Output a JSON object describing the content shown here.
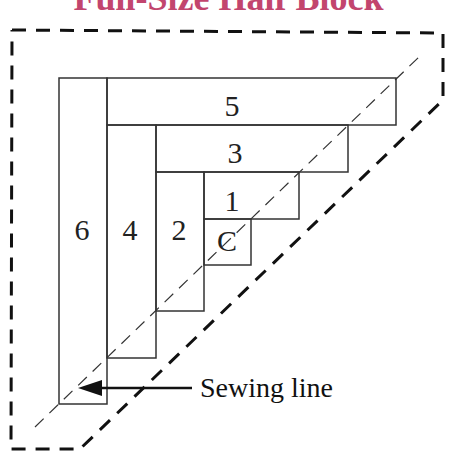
{
  "title": {
    "text": "Full-Size Half Block",
    "color": "#c2456e"
  },
  "diagram": {
    "pieces": [
      {
        "id": "C",
        "label": "C",
        "x": 204,
        "y": 219,
        "w": 47,
        "h": 46,
        "label_x": 227,
        "label_y": 251
      },
      {
        "id": "1",
        "label": "1",
        "x": 204,
        "y": 172,
        "w": 95,
        "h": 47,
        "label_x": 232,
        "label_y": 211
      },
      {
        "id": "2",
        "label": "2",
        "x": 156,
        "y": 172,
        "w": 48,
        "h": 139,
        "label_x": 179,
        "label_y": 240
      },
      {
        "id": "3",
        "label": "3",
        "x": 156,
        "y": 125,
        "w": 192,
        "h": 47,
        "label_x": 235,
        "label_y": 163
      },
      {
        "id": "4",
        "label": "4",
        "x": 107,
        "y": 125,
        "w": 49,
        "h": 233,
        "label_x": 130,
        "label_y": 240
      },
      {
        "id": "5",
        "label": "5",
        "x": 107,
        "y": 78,
        "w": 289,
        "h": 47,
        "label_x": 232,
        "label_y": 116
      },
      {
        "id": "6",
        "label": "6",
        "x": 59,
        "y": 78,
        "w": 48,
        "h": 326,
        "label_x": 82,
        "label_y": 240
      }
    ],
    "outline": {
      "points": "12,30 443,33 443,100 80,449 11,449 12,30",
      "style": "dashed"
    },
    "sewing_line": {
      "x1": 35,
      "y1": 427,
      "x2": 420,
      "y2": 56,
      "style": "dashed-thin"
    },
    "callout": {
      "label": "Sewing line",
      "arrow_from_x": 192,
      "arrow_from_y": 388,
      "arrow_to_x": 78,
      "arrow_to_y": 388,
      "text_x": 200,
      "text_y": 397
    },
    "colors": {
      "line": "#333333",
      "outline": "#111111"
    }
  }
}
